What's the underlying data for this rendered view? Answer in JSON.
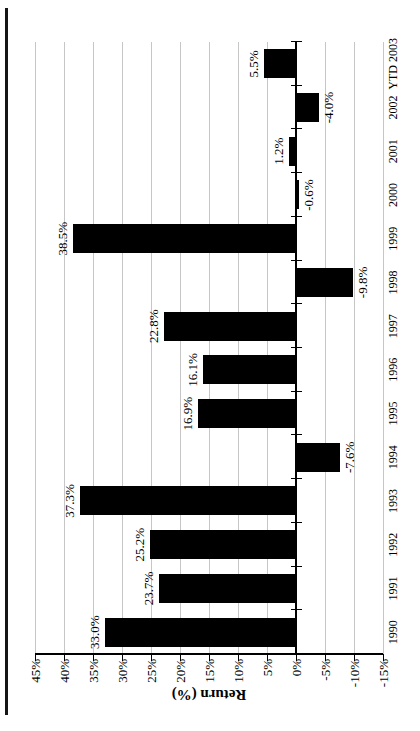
{
  "chart_data": {
    "type": "bar",
    "title": "",
    "categories": [
      "1990",
      "1991",
      "1992",
      "1993",
      "1994",
      "1995",
      "1996",
      "1997",
      "1998",
      "1999",
      "2000",
      "2001",
      "2002",
      "YTD 2003"
    ],
    "values": [
      33.0,
      23.7,
      25.2,
      37.3,
      -7.6,
      16.9,
      16.1,
      22.8,
      -9.8,
      38.5,
      -0.6,
      1.2,
      -4.0,
      5.5
    ],
    "value_labels": [
      "33.0%",
      "23.7%",
      "25.2%",
      "37.3%",
      "-7.6%",
      "16.9%",
      "16.1%",
      "22.8%",
      "-9.8%",
      "38.5%",
      "-0.6%",
      "1.2%",
      "-4.0%",
      "5.5%"
    ],
    "xlabel": "",
    "ylabel": "Return (%)",
    "ylim": [
      -15,
      45
    ],
    "ytick_step": 5,
    "ytick_labels": [
      "45%",
      "40%",
      "35%",
      "30%",
      "25%",
      "20%",
      "15%",
      "10%",
      "5%",
      "0%",
      "-5%",
      "-10%",
      "-15%"
    ],
    "grid": true,
    "legend": "none",
    "bar_color": "#000000",
    "axis_color": "#000000",
    "gridline_color": "#c6c6c6",
    "orientation": "landscape chart rotated 90deg counter-clockwise on portrait page"
  }
}
